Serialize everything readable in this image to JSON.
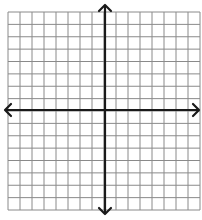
{
  "diagram": {
    "type": "coordinate-plane",
    "grid": {
      "columns": 16,
      "rows": 16,
      "left": 8,
      "top": 12,
      "right": 200,
      "bottom": 210,
      "line_color": "#8a8a8a",
      "background": "#ffffff"
    },
    "axes": {
      "origin_x": 105,
      "origin_y": 110,
      "color": "#1a1a1a",
      "x_axis": {
        "from": 5,
        "to": 199,
        "arrows": "both"
      },
      "y_axis": {
        "from": 5,
        "to": 214,
        "arrows": "both"
      }
    }
  }
}
